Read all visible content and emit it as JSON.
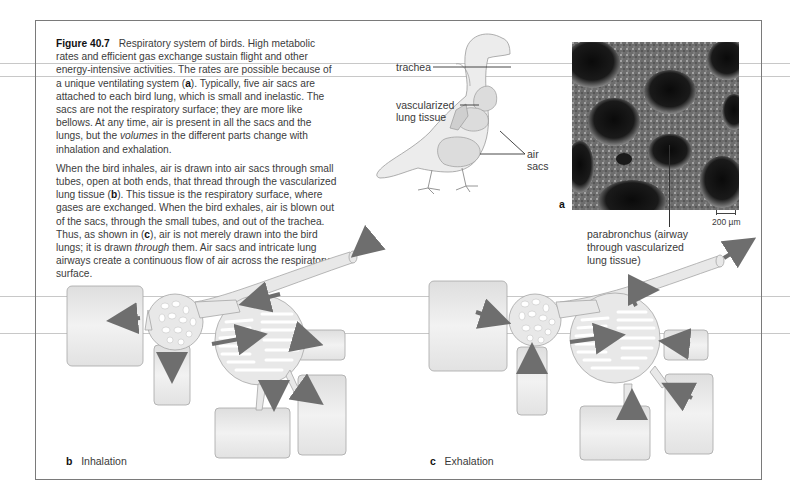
{
  "figure": {
    "number": "Figure 40.7",
    "title": "Respiratory system of birds.",
    "paragraphs": [
      {
        "segments": [
          {
            "text": "High metabolic rates and efficient gas exchange sustain flight and other energy-intensive activities. The rates are possible because of a unique ventilating system (",
            "style": "normal"
          },
          {
            "text": "a",
            "style": "bold"
          },
          {
            "text": "). Typically, five air sacs are attached to each bird lung, which is small and inelastic. The sacs are not the respiratory surface; they are more like bellows. At any time, air is present in all the sacs and the lungs, but the ",
            "style": "normal"
          },
          {
            "text": "volumes",
            "style": "italic"
          },
          {
            "text": " in the different parts change with inhalation and exhalation.",
            "style": "normal"
          }
        ]
      },
      {
        "segments": [
          {
            "text": "When the bird inhales, air is drawn into air sacs through small tubes, open at both ends, that thread through the vascularized lung tissue (",
            "style": "normal"
          },
          {
            "text": "b",
            "style": "bold"
          },
          {
            "text": "). This tissue is the respiratory surface, where gases are exchanged. When the bird exhales, air is blown out of the sacs, through the small tubes, and out of the trachea. Thus, as shown in (",
            "style": "normal"
          },
          {
            "text": "c",
            "style": "bold"
          },
          {
            "text": "), air is not merely drawn into the bird lungs; it is drawn ",
            "style": "normal"
          },
          {
            "text": "through",
            "style": "italic"
          },
          {
            "text": " them. Air sacs and intricate lung airways create a continuous flow of air across the respiratory surface.",
            "style": "normal"
          }
        ]
      }
    ]
  },
  "bird_labels": {
    "trachea": "trachea",
    "vascularized_1": "vascularized",
    "vascularized_2": "lung tissue",
    "air_sacs_1": "air",
    "air_sacs_2": "sacs"
  },
  "micrograph": {
    "panel_letter": "a",
    "scale_bar": "200 µm",
    "label_lines": [
      "parabronchus (airway",
      "through vascularized",
      "lung tissue)"
    ]
  },
  "panels": [
    {
      "letter": "b",
      "label": "Inhalation"
    },
    {
      "letter": "c",
      "label": "Exhalation"
    }
  ],
  "colors": {
    "frame": "#7a7a7a",
    "sac_fill": "#e6e6e6",
    "arrow": "#6e6e6e",
    "text": "#3a3a3a"
  }
}
